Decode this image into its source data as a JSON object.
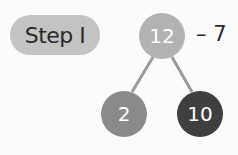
{
  "step_label": "Step I",
  "tree": {
    "root": {
      "value": "12",
      "color": "#b2b2b2"
    },
    "operation": "– 7",
    "left": {
      "value": "2",
      "color": "#8a8a8a"
    },
    "right": {
      "value": "10",
      "color": "#3f3f3f"
    }
  },
  "colors": {
    "pill": "#c3c3c3",
    "line": "#9a9a9a"
  }
}
